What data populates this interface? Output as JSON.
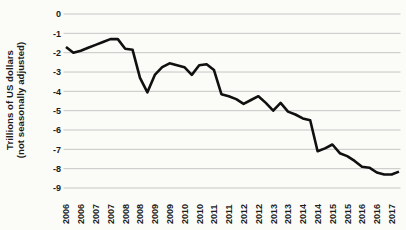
{
  "chart_data": {
    "type": "line",
    "title": "",
    "ylabel_lines": [
      "Trillions of US dollars",
      "(not seasonally adjusted)"
    ],
    "x": [
      "2006Q1",
      "2006Q2",
      "2006Q3",
      "2006Q4",
      "2007Q1",
      "2007Q2",
      "2007Q3",
      "2007Q4",
      "2008Q1",
      "2008Q2",
      "2008Q3",
      "2008Q4",
      "2009Q1",
      "2009Q2",
      "2009Q3",
      "2009Q4",
      "2010Q1",
      "2010Q2",
      "2010Q3",
      "2010Q4",
      "2011Q1",
      "2011Q2",
      "2011Q3",
      "2011Q4",
      "2012Q1",
      "2012Q2",
      "2012Q3",
      "2012Q4",
      "2013Q1",
      "2013Q2",
      "2013Q3",
      "2013Q4",
      "2014Q1",
      "2014Q2",
      "2014Q3",
      "2014Q4",
      "2015Q1",
      "2015Q2",
      "2015Q3",
      "2015Q4",
      "2016Q1",
      "2016Q2",
      "2016Q3",
      "2016Q4",
      "2017Q1",
      "2017Q2"
    ],
    "values": [
      -1.7,
      -2.0,
      -1.9,
      -1.75,
      -1.6,
      -1.45,
      -1.3,
      -1.3,
      -1.8,
      -1.85,
      -3.3,
      -4.05,
      -3.15,
      -2.75,
      -2.55,
      -2.65,
      -2.75,
      -3.15,
      -2.65,
      -2.6,
      -2.9,
      -4.15,
      -4.25,
      -4.4,
      -4.65,
      -4.45,
      -4.25,
      -4.6,
      -5.0,
      -4.6,
      -5.05,
      -5.2,
      -5.4,
      -5.5,
      -7.1,
      -6.95,
      -6.75,
      -7.2,
      -7.35,
      -7.6,
      -7.9,
      -7.95,
      -8.2,
      -8.3,
      -8.3,
      -8.15
    ],
    "x_axis_tick_labels": [
      "2006",
      "2006",
      "2007",
      "2007",
      "2008",
      "2008",
      "2009",
      "2009",
      "2010",
      "2010",
      "2011",
      "2011",
      "2012",
      "2012",
      "2013",
      "2013",
      "2014",
      "2014",
      "2015",
      "2015",
      "2016",
      "2016",
      "2017"
    ],
    "x_label_every_n_points": 2,
    "yticks": [
      "0",
      "-1",
      "-2",
      "-3",
      "-4",
      "-5",
      "-6",
      "-7",
      "-8",
      "-9"
    ],
    "ylim": [
      -9,
      0
    ],
    "grid": "horizontal",
    "legend": "none"
  },
  "style": {
    "line_color": "#101010",
    "grid_color": "#c6c6c6",
    "text_color": "#1c1c1c",
    "background": "#fbfbf8"
  }
}
